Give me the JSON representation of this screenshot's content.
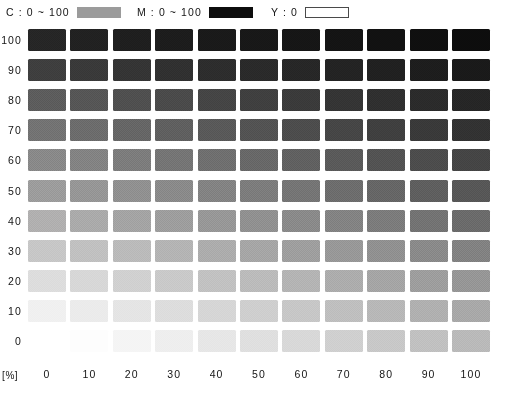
{
  "legend": {
    "entries": [
      {
        "label": "C : 0 ~ 100",
        "swatch": "mid-gray-bar",
        "color": "#9b9b9b",
        "name": "legend-cyan"
      },
      {
        "label": "M : 0 ~ 100",
        "swatch": "black-bar",
        "color": "#0d0d0d",
        "name": "legend-magenta"
      },
      {
        "label": "Y : 0",
        "swatch": "empty-outline-bar",
        "color": "#ffffff",
        "name": "legend-yellow"
      }
    ]
  },
  "axes": {
    "y_unit": "[%]",
    "x_unit": "[%]",
    "y_ticks": [
      "100",
      "90",
      "80",
      "70",
      "60",
      "50",
      "40",
      "30",
      "20",
      "10",
      "0"
    ],
    "x_ticks": [
      "0",
      "10",
      "20",
      "30",
      "40",
      "50",
      "60",
      "70",
      "80",
      "90",
      "100"
    ]
  },
  "chart_data": {
    "type": "heatmap",
    "title": "",
    "subtitle": "",
    "xlabel": "[%]",
    "ylabel": "[%]",
    "legend_position": "top",
    "grid": false,
    "x_series_name": "M",
    "y_series_name": "C",
    "constant": {
      "Y": 0,
      "K": 0
    },
    "xlim": [
      0,
      100
    ],
    "ylim": [
      0,
      100
    ],
    "x": [
      0,
      10,
      20,
      30,
      40,
      50,
      60,
      70,
      80,
      90,
      100
    ],
    "y": [
      100,
      90,
      80,
      70,
      60,
      50,
      40,
      30,
      20,
      10,
      0
    ],
    "value_unit": "%",
    "cell_appearance": "halftone-screened-gray-patch",
    "rows": [
      {
        "c": 100,
        "colors": [
          "#232323",
          "#1f1f1f",
          "#1c1c1c",
          "#1a1a1a",
          "#181818",
          "#161616",
          "#141414",
          "#121212",
          "#101010",
          "#0e0e0e",
          "#0c0c0c"
        ]
      },
      {
        "c": 90,
        "colors": [
          "#3a3a3a",
          "#353535",
          "#313131",
          "#2d2d2d",
          "#2a2a2a",
          "#272727",
          "#242424",
          "#212121",
          "#1e1e1e",
          "#1b1b1b",
          "#181818"
        ]
      },
      {
        "c": 80,
        "colors": [
          "#565656",
          "#505050",
          "#4a4a4a",
          "#454545",
          "#404040",
          "#3b3b3b",
          "#363636",
          "#313131",
          "#2c2c2c",
          "#282828",
          "#232323"
        ]
      },
      {
        "c": 70,
        "colors": [
          "#6b6b6b",
          "#656565",
          "#5f5f5f",
          "#595959",
          "#535353",
          "#4d4d4d",
          "#474747",
          "#414141",
          "#3b3b3b",
          "#353535",
          "#2f2f2f"
        ]
      },
      {
        "c": 60,
        "colors": [
          "#808080",
          "#7a7a7a",
          "#747474",
          "#6d6d6d",
          "#676767",
          "#616161",
          "#5a5a5a",
          "#545454",
          "#4d4d4d",
          "#474747",
          "#404040"
        ]
      },
      {
        "c": 50,
        "colors": [
          "#959595",
          "#8e8e8e",
          "#888888",
          "#818181",
          "#7a7a7a",
          "#747474",
          "#6d6d6d",
          "#666666",
          "#5f5f5f",
          "#585858",
          "#515151"
        ]
      },
      {
        "c": 40,
        "colors": [
          "#abaaaa",
          "#a4a4a4",
          "#9d9d9d",
          "#969696",
          "#8f8f8f",
          "#888888",
          "#818181",
          "#7a7a7a",
          "#737373",
          "#6b6b6b",
          "#646464"
        ]
      },
      {
        "c": 30,
        "colors": [
          "#c3c3c3",
          "#bcbcbc",
          "#b5b5b5",
          "#aeaeae",
          "#a6a6a6",
          "#9f9f9f",
          "#979797",
          "#909090",
          "#888888",
          "#818181",
          "#797979"
        ]
      },
      {
        "c": 20,
        "colors": [
          "#dbdbdb",
          "#d4d4d4",
          "#cdcdcd",
          "#c5c5c5",
          "#bdbdbd",
          "#b6b6b6",
          "#aeaeae",
          "#a6a6a6",
          "#9e9e9e",
          "#969696",
          "#8e8e8e"
        ]
      },
      {
        "c": 10,
        "colors": [
          "#efefef",
          "#eaeaea",
          "#e3e3e3",
          "#dbdbdb",
          "#d3d3d3",
          "#cbcbcb",
          "#c3c3c3",
          "#bababa",
          "#b2b2b2",
          "#aaaaaa",
          "#a2a2a2"
        ]
      },
      {
        "c": 0,
        "colors": [
          "#ffffff",
          "#fdfdfd",
          "#f4f4f4",
          "#ededed",
          "#e5e5e5",
          "#dddddd",
          "#d5d5d5",
          "#cccccc",
          "#c4c4c4",
          "#bcbcbc",
          "#b4b4b4"
        ]
      }
    ]
  }
}
